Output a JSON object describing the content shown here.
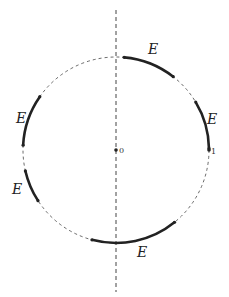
{
  "diagram": {
    "type": "unit-circle-arcs",
    "center": {
      "x": 116,
      "y": 150
    },
    "radius": 93,
    "axis": {
      "x": 116,
      "y_top": 10,
      "y_bottom": 292
    },
    "points": {
      "origin_label": "0",
      "one_label": "1"
    },
    "arcs": [
      {
        "label": "E",
        "start_deg": 85,
        "end_deg": 52,
        "label_x": 148,
        "label_y": 54
      },
      {
        "label": "E",
        "start_deg": 31,
        "end_deg": 1,
        "label_x": 207,
        "label_y": 124
      },
      {
        "label": "E",
        "start_deg": 145,
        "end_deg": 177,
        "label_x": 16,
        "label_y": 123
      },
      {
        "label": "E",
        "start_deg": 193,
        "end_deg": 213,
        "label_x": 12,
        "label_y": 194
      },
      {
        "label": "E",
        "start_deg": 255,
        "end_deg": 309,
        "label_x": 137,
        "label_y": 257
      }
    ],
    "colors": {
      "stroke": "#222222",
      "dashed": "#444444"
    }
  }
}
